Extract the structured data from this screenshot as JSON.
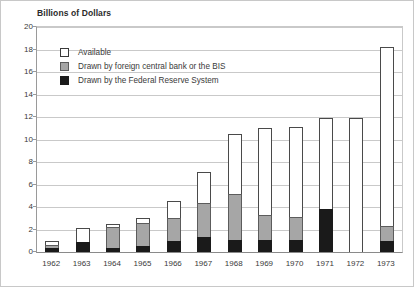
{
  "chart_data": {
    "type": "bar",
    "stacked": true,
    "title": "Billions of Dollars",
    "xlabel": "",
    "ylabel": "",
    "ylim": [
      0,
      20
    ],
    "ytick_step": 2,
    "yticks": [
      0,
      2,
      4,
      6,
      8,
      10,
      12,
      14,
      16,
      18,
      20
    ],
    "grid": true,
    "legend_position": "inside-top-left",
    "categories": [
      "1962",
      "1963",
      "1964",
      "1965",
      "1966",
      "1967",
      "1968",
      "1969",
      "1970",
      "1971",
      "1972",
      "1973"
    ],
    "series": [
      {
        "name": "Drawn by the Federal Reserve System",
        "color": "#1a1a1a",
        "values": [
          0.35,
          0.9,
          0.4,
          0.5,
          1.0,
          1.3,
          1.1,
          1.1,
          1.1,
          3.8,
          0.0,
          1.0
        ]
      },
      {
        "name": "Drawn by foreign central bank or the BIS",
        "color": "#a6a6a6",
        "values": [
          0.3,
          0.0,
          1.8,
          2.1,
          2.0,
          3.1,
          4.1,
          2.2,
          2.0,
          0.0,
          0.0,
          1.3
        ]
      },
      {
        "name": "Available",
        "color": "#ffffff",
        "values": [
          0.35,
          1.2,
          0.3,
          0.4,
          1.5,
          2.7,
          5.3,
          7.7,
          8.0,
          8.1,
          11.9,
          15.9
        ]
      }
    ],
    "totals": [
      1.0,
      2.1,
      2.5,
      3.0,
      4.5,
      7.1,
      10.5,
      11.0,
      11.1,
      11.9,
      11.9,
      18.2
    ]
  },
  "legend": {
    "items": [
      {
        "label": "Available",
        "swatch": "white"
      },
      {
        "label": "Drawn by foreign central bank or the BIS",
        "swatch": "gray"
      },
      {
        "label": "Drawn by the Federal Reserve System",
        "swatch": "black"
      }
    ]
  }
}
